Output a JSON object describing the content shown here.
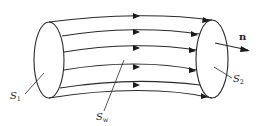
{
  "diagram": {
    "colors": {
      "line": "#2a2a2a",
      "background": "#ffffff"
    },
    "surfaces": [
      {
        "id": "S1",
        "base": "S",
        "sub": "1",
        "role": "inlet cross-section"
      },
      {
        "id": "S2",
        "base": "S",
        "sub": "2",
        "role": "outlet cross-section"
      },
      {
        "id": "Sw",
        "base": "S",
        "sub": "w",
        "role": "tube wall (lateral surface)"
      }
    ],
    "normal_vector": {
      "label": "n"
    },
    "flow_lines": 5
  }
}
